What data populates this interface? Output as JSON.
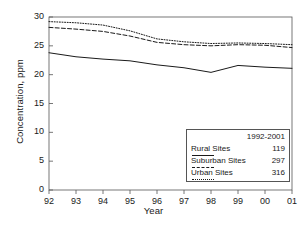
{
  "chart_data": {
    "type": "line",
    "title": "",
    "xlabel": "Year",
    "ylabel": "Concentration, ppm",
    "x": [
      "92",
      "93",
      "94",
      "95",
      "96",
      "97",
      "98",
      "99",
      "00",
      "01"
    ],
    "xtick_labels": [
      "92",
      "93",
      "94",
      "95",
      "96",
      "97",
      "98",
      "99",
      "00",
      "01"
    ],
    "ytick_labels": [
      "0",
      "5",
      "10",
      "15",
      "20",
      "25",
      "30"
    ],
    "ylim": [
      0,
      30
    ],
    "ytick_step": 5,
    "grid": false,
    "legend_position": "lower-right",
    "series": [
      {
        "name": "Rural Sites",
        "style": "solid",
        "count": "119",
        "values": [
          23.8,
          23.1,
          22.7,
          22.4,
          21.7,
          21.2,
          20.4,
          21.6,
          21.3,
          21.1
        ]
      },
      {
        "name": "Suburban Sites",
        "style": "dashed",
        "count": "297",
        "values": [
          28.2,
          27.9,
          27.5,
          26.7,
          25.6,
          25.2,
          25.0,
          25.2,
          25.1,
          24.7
        ]
      },
      {
        "name": "Urban Sites",
        "style": "dotted",
        "count": "316",
        "values": [
          29.2,
          29.0,
          28.6,
          27.6,
          26.2,
          25.7,
          25.4,
          25.5,
          25.4,
          25.2
        ]
      }
    ]
  },
  "legend": {
    "header": "1992-2001",
    "rows": [
      {
        "label": "Rural Sites",
        "value": "119"
      },
      {
        "label": "Suburban Sites",
        "value": "297"
      },
      {
        "label": "Urban Sites",
        "value": "316"
      }
    ]
  },
  "colors": {
    "axis": "#555555",
    "line": "#1a1a1a",
    "background": "#ffffff"
  }
}
